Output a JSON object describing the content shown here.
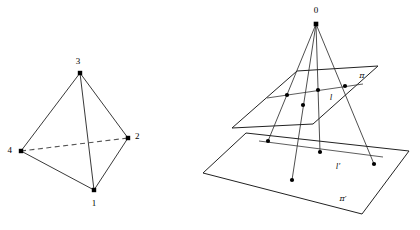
{
  "figure": {
    "canvas": {
      "width": 420,
      "height": 230,
      "background": "#ffffff"
    },
    "stroke_color": "#222222",
    "dot_color": "#000000"
  },
  "left_diagram": {
    "name": "tetrahedron",
    "vertices": [
      {
        "id": "v1",
        "label": "1",
        "x": 94,
        "y": 190,
        "label_x": 94,
        "label_y": 204,
        "anchor": "middle"
      },
      {
        "id": "v2",
        "label": "2",
        "x": 128,
        "y": 138,
        "label_x": 135,
        "label_y": 137,
        "anchor": "start"
      },
      {
        "id": "v3",
        "label": "3",
        "x": 80,
        "y": 73,
        "label_x": 78,
        "label_y": 62,
        "anchor": "middle"
      },
      {
        "id": "v4",
        "label": "4",
        "x": 21,
        "y": 151,
        "label_x": 12,
        "label_y": 151,
        "anchor": "end"
      }
    ],
    "solid_edges": [
      {
        "from": "v3",
        "to": "v4"
      },
      {
        "from": "v3",
        "to": "v2"
      },
      {
        "from": "v3",
        "to": "v1"
      },
      {
        "from": "v4",
        "to": "v1"
      },
      {
        "from": "v1",
        "to": "v2"
      }
    ],
    "dashed_edges": [
      {
        "from": "v4",
        "to": "v2"
      }
    ]
  },
  "right_diagram": {
    "name": "central-projection-between-planes",
    "center": {
      "label": "0",
      "x": 316,
      "y": 24,
      "label_x": 316,
      "label_y": 11
    },
    "plane_upper": {
      "label": "π",
      "label_x": 362,
      "label_y": 76,
      "corners": [
        {
          "x": 232,
          "y": 128
        },
        {
          "x": 297,
          "y": 71
        },
        {
          "x": 378,
          "y": 66
        },
        {
          "x": 313,
          "y": 124
        }
      ]
    },
    "plane_lower": {
      "label": "π′",
      "label_x": 343,
      "label_y": 199,
      "corners": [
        {
          "x": 203,
          "y": 173
        },
        {
          "x": 246,
          "y": 133
        },
        {
          "x": 409,
          "y": 151
        },
        {
          "x": 362,
          "y": 214
        }
      ]
    },
    "line_upper": {
      "label": "l",
      "label_x": 331,
      "label_y": 98,
      "from": {
        "x": 267,
        "y": 98
      },
      "to": {
        "x": 363,
        "y": 84
      }
    },
    "line_lower": {
      "label": "l′",
      "label_x": 338,
      "label_y": 167,
      "from": {
        "x": 259,
        "y": 141
      },
      "to": {
        "x": 383,
        "y": 157
      }
    },
    "points_upper": [
      {
        "x": 287,
        "y": 95
      },
      {
        "x": 318,
        "y": 90
      },
      {
        "x": 345,
        "y": 86
      },
      {
        "x": 303,
        "y": 105
      }
    ],
    "points_lower": [
      {
        "x": 268,
        "y": 141
      },
      {
        "x": 320,
        "y": 152
      },
      {
        "x": 374,
        "y": 164
      },
      {
        "x": 292,
        "y": 180
      }
    ],
    "rays": [
      {
        "from": {
          "x": 316,
          "y": 24
        },
        "to": {
          "x": 268,
          "y": 141
        }
      },
      {
        "from": {
          "x": 316,
          "y": 24
        },
        "to": {
          "x": 320,
          "y": 152
        }
      },
      {
        "from": {
          "x": 316,
          "y": 24
        },
        "to": {
          "x": 374,
          "y": 164
        }
      },
      {
        "from": {
          "x": 316,
          "y": 24
        },
        "to": {
          "x": 292,
          "y": 180
        }
      }
    ]
  }
}
